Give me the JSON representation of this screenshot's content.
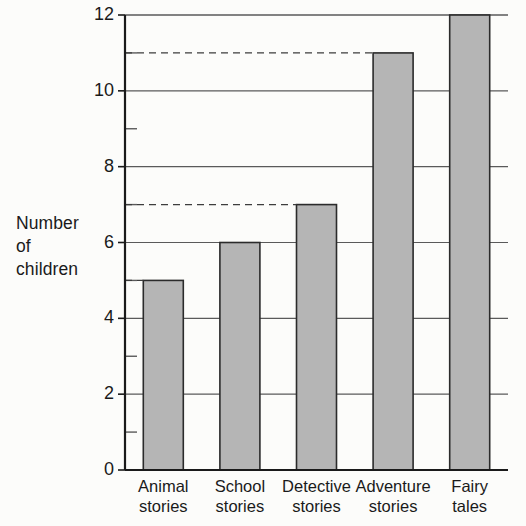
{
  "chart_data": {
    "type": "bar",
    "title": "",
    "subtitle": "",
    "xlabel": "",
    "ylabel": "Number of children",
    "ylabel_lines": [
      "Number",
      "of",
      "children"
    ],
    "categories": [
      "Animal stories",
      "School stories",
      "Detective stories",
      "Adventure stories",
      "Fairy tales"
    ],
    "category_lines": [
      [
        "Animal",
        "stories"
      ],
      [
        "School",
        "stories"
      ],
      [
        "Detective",
        "stories"
      ],
      [
        "Adventure",
        "stories"
      ],
      [
        "Fairy",
        "tales"
      ]
    ],
    "values": [
      5,
      6,
      7,
      11,
      12
    ],
    "ylim": [
      0,
      12
    ],
    "ytick_labels": [
      "0",
      "2",
      "4",
      "6",
      "8",
      "10",
      "12"
    ],
    "ytick_values": [
      0,
      2,
      4,
      6,
      8,
      10,
      12
    ],
    "yminor_values": [
      1,
      3,
      5,
      7,
      9,
      11
    ],
    "grid": true,
    "grid_axis": "y",
    "legend": "none",
    "annotations": [
      {
        "type": "dashed-guide",
        "value": 5,
        "to_category": "Animal stories"
      },
      {
        "type": "dashed-guide",
        "value": 7,
        "to_category": "Detective stories"
      },
      {
        "type": "dashed-guide",
        "value": 11,
        "to_category": "Adventure stories"
      }
    ],
    "colors": {
      "bar_fill": "#b5b5b5",
      "bar_stroke": "#2b2b2b",
      "grid": "#5a5a5a",
      "axis": "#1a1a1a",
      "text": "#1a1a1a",
      "background": "#fcfcfa"
    }
  },
  "yticks": [
    {
      "label": "12",
      "value": 12
    },
    {
      "label": "10",
      "value": 10
    },
    {
      "label": "8",
      "value": 8
    },
    {
      "label": "6",
      "value": 6
    },
    {
      "label": "4",
      "value": 4
    },
    {
      "label": "2",
      "value": 2
    },
    {
      "label": "0",
      "value": 0
    }
  ],
  "ylabel": {
    "line1": "Number",
    "line2": "of",
    "line3": "children"
  },
  "categories": [
    {
      "line1": "Animal",
      "line2": "stories"
    },
    {
      "line1": "School",
      "line2": "stories"
    },
    {
      "line1": "Detective",
      "line2": "stories"
    },
    {
      "line1": "Adventure",
      "line2": "stories"
    },
    {
      "line1": "Fairy",
      "line2": "tales"
    }
  ]
}
